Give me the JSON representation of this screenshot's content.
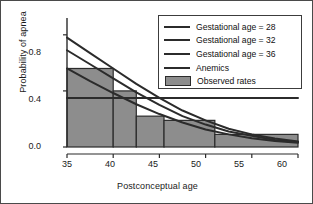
{
  "chart_data": {
    "type": "line",
    "title": "",
    "xlabel": "Postconceptual age",
    "ylabel": "Probability of apnea",
    "xlim": [
      35,
      60
    ],
    "ylim": [
      0.0,
      0.92
    ],
    "xticks": [
      35,
      40,
      45,
      50,
      55,
      60
    ],
    "xtick_labels": [
      "35",
      "40",
      "45",
      "50",
      "55",
      "60"
    ],
    "yticks": [
      0.0,
      0.4,
      0.8
    ],
    "ytick_labels": [
      "0.0",
      "0.4",
      "0.8"
    ],
    "grid": false,
    "legend_position": "top-right",
    "series": [
      {
        "name": "Gestational age = 28",
        "style": "line",
        "color": "#2b2b2b",
        "x": [
          35,
          37.5,
          40,
          42.5,
          45,
          47.5,
          50,
          52.5,
          55,
          57.5,
          60
        ],
        "values": [
          0.78,
          0.67,
          0.56,
          0.45,
          0.35,
          0.26,
          0.19,
          0.13,
          0.09,
          0.06,
          0.04
        ]
      },
      {
        "name": "Gestational age = 32",
        "style": "line",
        "color": "#2b2b2b",
        "x": [
          35,
          37.5,
          40,
          42.5,
          45,
          47.5,
          50,
          52.5,
          55,
          57.5,
          60
        ],
        "values": [
          0.69,
          0.59,
          0.49,
          0.39,
          0.3,
          0.22,
          0.16,
          0.11,
          0.08,
          0.05,
          0.035
        ]
      },
      {
        "name": "Gestational age = 36",
        "style": "line",
        "color": "#2b2b2b",
        "x": [
          35,
          37.5,
          40,
          42.5,
          45,
          47.5,
          50,
          52.5,
          55,
          57.5,
          60
        ],
        "values": [
          0.56,
          0.47,
          0.385,
          0.305,
          0.235,
          0.175,
          0.125,
          0.09,
          0.062,
          0.042,
          0.03
        ]
      },
      {
        "name": "Anemics",
        "style": "line",
        "color": "#2b2b2b",
        "x": [
          35,
          40,
          45,
          50,
          55,
          60
        ],
        "values": [
          0.35,
          0.35,
          0.35,
          0.35,
          0.35,
          0.35
        ]
      },
      {
        "name": "Observed rates",
        "style": "bar",
        "color": "#8d8d8d",
        "bar_edges": [
          35,
          40,
          42.5,
          45.5,
          51,
          60
        ],
        "values": [
          0.56,
          0.4,
          0.22,
          0.19,
          0.09
        ]
      }
    ]
  },
  "axes": {
    "ylabel": "Probability of apnea",
    "xlabel": "Postconceptual age"
  },
  "legend": {
    "items": [
      {
        "label": "Gestational age = 28",
        "marker": "line"
      },
      {
        "label": "Gestational age = 32",
        "marker": "line"
      },
      {
        "label": "Gestational age = 36",
        "marker": "line"
      },
      {
        "label": "Anemics",
        "marker": "line"
      },
      {
        "label": "Observed rates",
        "marker": "swatch"
      }
    ]
  },
  "colors": {
    "line": "#2b2b2b",
    "bar_fill": "#8d8d8d",
    "bar_edge": "#2b2b2b",
    "axis": "#2b2b2b",
    "border": "#4a4a4a",
    "background": "#ffffff"
  }
}
